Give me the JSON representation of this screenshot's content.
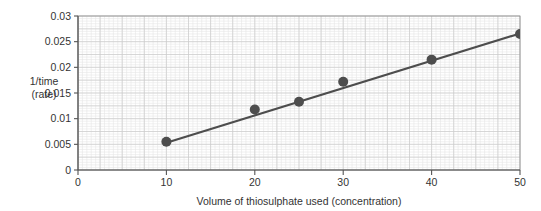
{
  "chart_data": {
    "type": "scatter",
    "title": "",
    "subtitle": "",
    "xlabel": "Volume of thiosulphate used (concentration)",
    "ylabel": "1/time\n(rate)",
    "ylabel_lines": [
      "1/time",
      "(rate)"
    ],
    "xlim": [
      0,
      50
    ],
    "ylim": [
      0,
      0.03
    ],
    "xticks": [
      0,
      10,
      20,
      30,
      40,
      50
    ],
    "yticks": [
      0,
      0.005,
      0.01,
      0.015,
      0.02,
      0.025,
      0.03
    ],
    "xtick_labels": [
      "0",
      "10",
      "20",
      "30",
      "40",
      "50"
    ],
    "ytick_labels": [
      "0",
      "0.005",
      "0.01",
      "0.015",
      "0.02",
      "0.025",
      "0.03"
    ],
    "grid": true,
    "grid_minor": true,
    "grid_minor_step_x": 0.5,
    "grid_minor_step_y": 0.0005,
    "grid_major_step_x": 2.5,
    "grid_major_step_y": 0.0025,
    "legend": "none",
    "x": [
      10,
      20,
      25,
      30,
      40,
      50
    ],
    "values": [
      0.0055,
      0.0118,
      0.0133,
      0.0172,
      0.0215,
      0.0265
    ],
    "series": [
      {
        "name": "1/time (rate)",
        "x": [
          10,
          20,
          25,
          30,
          40,
          50
        ],
        "values": [
          0.0055,
          0.0118,
          0.0133,
          0.0172,
          0.0215,
          0.0265
        ],
        "marker": "circle",
        "marker_color": "#4d4d4d",
        "marker_size": 5
      }
    ],
    "trendline": {
      "type": "line",
      "x": [
        10,
        50
      ],
      "values": [
        0.0053,
        0.0266
      ],
      "color": "#4d4d4d",
      "width": 2.2
    },
    "colors": {
      "marker": "#4d4d4d",
      "line": "#4d4d4d",
      "axis": "#555555",
      "grid_minor": "#e6e6e6",
      "grid_major": "#cccccc",
      "text": "#333333",
      "background": "#ffffff"
    }
  }
}
